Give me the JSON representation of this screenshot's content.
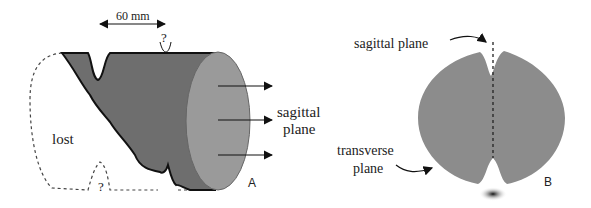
{
  "panel_a": {
    "dimension_label": "60 mm",
    "question_mark_top": "?",
    "question_mark_bottom": "?",
    "lost_label": "lost",
    "plane_label_line1": "sagittal",
    "plane_label_line2": "plane",
    "panel_letter": "A"
  },
  "panel_b": {
    "sagittal_label": "sagittal plane",
    "transverse_label_line1": "transverse",
    "transverse_label_line2": "plane",
    "panel_letter": "B"
  },
  "colors": {
    "body_dark": "#6e6e6e",
    "face_light": "#9a9a9a",
    "disc_gray": "#8c8c8c",
    "outline": "#111111"
  }
}
